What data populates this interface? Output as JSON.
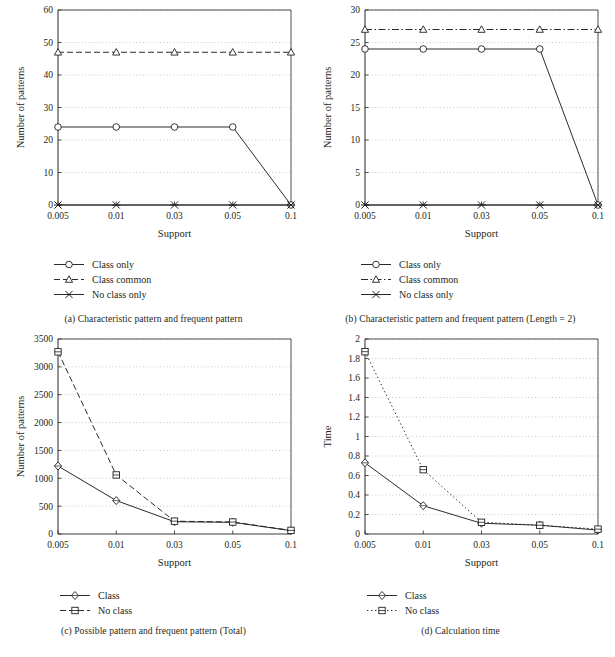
{
  "figure": {
    "panels": [
      "a",
      "b",
      "c",
      "d"
    ]
  },
  "panel_a": {
    "caption": "(a)  Characteristic pattern and frequent pattern",
    "legend": [
      {
        "label": "Class only",
        "marker": "circle",
        "line": "solid"
      },
      {
        "label": "Class common",
        "marker": "triangle",
        "line": "dashed"
      },
      {
        "label": "No class only",
        "marker": "asterisk",
        "line": "solid"
      }
    ],
    "chart_data": {
      "type": "line",
      "title": "",
      "xlabel": "Support",
      "ylabel": "Number of patterns",
      "categories": [
        "0.005",
        "0.01",
        "0.03",
        "0.05",
        "0.1"
      ],
      "x": [
        0.005,
        0.01,
        0.03,
        0.05,
        0.1
      ],
      "ylim": [
        0,
        60
      ],
      "yticks": [
        0,
        10,
        20,
        30,
        40,
        50,
        60
      ],
      "grid": true,
      "legend_position": "below",
      "series": [
        {
          "name": "Class only",
          "marker": "circle",
          "line": "solid",
          "values": [
            24,
            24,
            24,
            24,
            0
          ]
        },
        {
          "name": "Class common",
          "marker": "triangle",
          "line": "dashed",
          "values": [
            47,
            47,
            47,
            47,
            47
          ]
        },
        {
          "name": "No class only",
          "marker": "asterisk",
          "line": "solid",
          "values": [
            0,
            0,
            0,
            0,
            0
          ]
        }
      ]
    }
  },
  "panel_b": {
    "caption": "(b)  Characteristic pattern and frequent pattern (Length = 2)",
    "legend": [
      {
        "label": "Class only",
        "marker": "circle",
        "line": "solid"
      },
      {
        "label": "Class common",
        "marker": "triangle",
        "line": "dashdot"
      },
      {
        "label": "No class only",
        "marker": "asterisk",
        "line": "solid"
      }
    ],
    "chart_data": {
      "type": "line",
      "title": "",
      "xlabel": "Support",
      "ylabel": "Number of patterns",
      "categories": [
        "0.005",
        "0.01",
        "0.03",
        "0.05",
        "0.1"
      ],
      "x": [
        0.005,
        0.01,
        0.03,
        0.05,
        0.1
      ],
      "ylim": [
        0,
        30
      ],
      "yticks": [
        0,
        5,
        10,
        15,
        20,
        25,
        30
      ],
      "grid": true,
      "legend_position": "below",
      "series": [
        {
          "name": "Class only",
          "marker": "circle",
          "line": "solid",
          "values": [
            24,
            24,
            24,
            24,
            0
          ]
        },
        {
          "name": "Class common",
          "marker": "triangle",
          "line": "dashdot",
          "values": [
            27,
            27,
            27,
            27,
            27
          ]
        },
        {
          "name": "No class only",
          "marker": "asterisk",
          "line": "solid",
          "values": [
            0,
            0,
            0,
            0,
            0
          ]
        }
      ]
    }
  },
  "panel_c": {
    "caption": "(c)  Possible pattern and frequent pattern (Total)",
    "legend": [
      {
        "label": "Class",
        "marker": "diamond",
        "line": "solid"
      },
      {
        "label": "No class",
        "marker": "square",
        "line": "dashed"
      }
    ],
    "chart_data": {
      "type": "line",
      "title": "",
      "xlabel": "Support",
      "ylabel": "Number of patterns",
      "categories": [
        "0.005",
        "0.01",
        "0.03",
        "0.05",
        "0.1"
      ],
      "x": [
        0.005,
        0.01,
        0.03,
        0.05,
        0.1
      ],
      "ylim": [
        0,
        3500
      ],
      "yticks": [
        0,
        500,
        1000,
        1500,
        2000,
        2500,
        3000,
        3500
      ],
      "grid": true,
      "legend_position": "below",
      "series": [
        {
          "name": "Class",
          "marker": "diamond",
          "line": "solid",
          "values": [
            1220,
            600,
            220,
            210,
            60
          ]
        },
        {
          "name": "No class",
          "marker": "square",
          "line": "dashed",
          "values": [
            3270,
            1060,
            230,
            215,
            65
          ]
        }
      ]
    }
  },
  "panel_d": {
    "caption": "(d)  Calculation time",
    "legend": [
      {
        "label": "Class",
        "marker": "diamond",
        "line": "solid"
      },
      {
        "label": "No class",
        "marker": "square",
        "line": "dotted"
      }
    ],
    "chart_data": {
      "type": "line",
      "title": "",
      "xlabel": "Support",
      "ylabel": "Time",
      "categories": [
        "0.005",
        "0.01",
        "0.03",
        "0.05",
        "0.1"
      ],
      "x": [
        0.005,
        0.01,
        0.03,
        0.05,
        0.1
      ],
      "ylim": [
        0,
        2
      ],
      "yticks": [
        0,
        0.2,
        0.4,
        0.6,
        0.8,
        1,
        1.2,
        1.4,
        1.6,
        1.8,
        2
      ],
      "ytick_labels": [
        "0",
        "0.2",
        "0.4",
        "0.6",
        "0.8",
        "1",
        "1.2",
        "1.4",
        "1.6",
        "1.8",
        "2"
      ],
      "grid": true,
      "legend_position": "below",
      "series": [
        {
          "name": "Class",
          "marker": "diamond",
          "line": "solid",
          "values": [
            0.73,
            0.29,
            0.11,
            0.09,
            0.04
          ]
        },
        {
          "name": "No class",
          "marker": "square",
          "line": "dotted",
          "values": [
            1.87,
            0.66,
            0.12,
            0.09,
            0.05
          ]
        }
      ]
    }
  },
  "style": {
    "ink": "#231f20",
    "grid_color": "#b9b9b9",
    "axis_color": "#3a3a3a"
  }
}
